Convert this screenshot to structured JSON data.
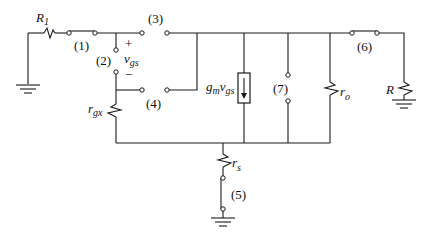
{
  "diagram": {
    "stroke_color": "#1a1a1a",
    "background": "#ffffff",
    "components": {
      "R1": {
        "symbol": "R",
        "subscript": "1",
        "type": "resistor"
      },
      "rgx": {
        "symbol": "r",
        "subscript": "gx",
        "type": "resistor"
      },
      "current_source": {
        "symbol": "g",
        "sub1": "m",
        "mid": "v",
        "sub2": "gs",
        "type": "dependent-current-source",
        "direction": "down"
      },
      "ro": {
        "symbol": "r",
        "subscript": "o",
        "type": "resistor"
      },
      "R": {
        "symbol": "R",
        "type": "resistor"
      },
      "rs": {
        "symbol": "r",
        "subscript": "s",
        "type": "resistor"
      },
      "vgs": {
        "symbol": "v",
        "subscript": "gs",
        "plus": "+",
        "minus": "−"
      }
    },
    "terminals": [
      {
        "id": "1",
        "label": "(1)",
        "state": "closed"
      },
      {
        "id": "2",
        "label": "(2)",
        "state": "open"
      },
      {
        "id": "3",
        "label": "(3)",
        "state": "open"
      },
      {
        "id": "4",
        "label": "(4)",
        "state": "open"
      },
      {
        "id": "5",
        "label": "(5)",
        "state": "closed"
      },
      {
        "id": "6",
        "label": "(6)",
        "state": "closed"
      },
      {
        "id": "7",
        "label": "(7)",
        "state": "open"
      }
    ],
    "grounds": [
      "ground-left",
      "ground-bottom",
      "ground-right"
    ]
  }
}
